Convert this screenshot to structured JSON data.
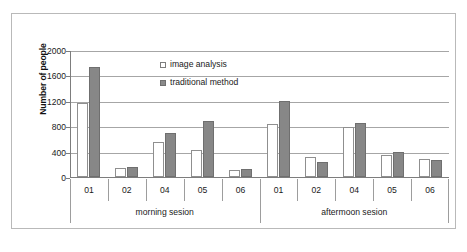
{
  "chart_data": {
    "type": "bar",
    "title": "",
    "xlabel": "",
    "ylabel": "Number of people",
    "ylim": [
      0,
      2000
    ],
    "yticks": [
      0,
      400,
      800,
      1200,
      1600,
      2000
    ],
    "grid": true,
    "legend_position": "inside-top-left",
    "categories": [
      "01",
      "02",
      "04",
      "05",
      "06",
      "01",
      "02",
      "04",
      "05",
      "06"
    ],
    "groups": [
      {
        "label": "morning sesion",
        "categories": [
          "01",
          "02",
          "04",
          "05",
          "06"
        ]
      },
      {
        "label": "aftermoon sesion",
        "categories": [
          "01",
          "02",
          "04",
          "05",
          "06"
        ]
      }
    ],
    "series": [
      {
        "name": "image analysis",
        "color": "#ffffff",
        "values": [
          1160,
          140,
          550,
          425,
          110,
          830,
          320,
          780,
          345,
          290
        ]
      },
      {
        "name": "traditional method",
        "color": "#878787",
        "values": [
          1730,
          155,
          700,
          890,
          125,
          1200,
          230,
          845,
          390,
          265
        ]
      }
    ]
  },
  "axis": {
    "y_title": "Number of people",
    "y_ticks": [
      "2000",
      "1600",
      "1200",
      "800",
      "400",
      "0"
    ]
  },
  "legend": {
    "items": [
      {
        "label": "image analysis",
        "swatch": "light-square-icon"
      },
      {
        "label": "traditional method",
        "swatch": "dark-square-icon"
      }
    ]
  },
  "caption": {
    "text": ""
  }
}
